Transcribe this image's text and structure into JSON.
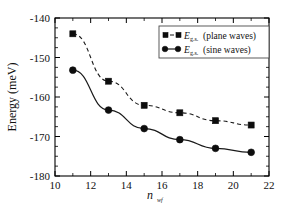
{
  "chart_data": {
    "type": "line",
    "title": "",
    "xlabel": "n_wf",
    "xlabel_base": "n",
    "xlabel_sub": "wf",
    "ylabel": "Energy (meV)",
    "xlim": [
      10,
      22
    ],
    "ylim": [
      -180,
      -140
    ],
    "grid": false,
    "legend_position": "top-right",
    "xticks": [
      10,
      12,
      14,
      16,
      18,
      20,
      22
    ],
    "xticklabels": [
      "10",
      "12",
      "14",
      "16",
      "18",
      "20",
      "22"
    ],
    "yticks": [
      -180,
      -170,
      -160,
      -150,
      -140
    ],
    "yticklabels": [
      "-180",
      "-170",
      "-160",
      "-150",
      "-140"
    ],
    "x": [
      11,
      13,
      15,
      17,
      19,
      21
    ],
    "series": [
      {
        "name": "E_g.s. (plane waves)",
        "label_base": "E",
        "label_sub": "g.s.",
        "label_tail": "(plane waves)",
        "marker": "square",
        "linestyle": "dashed",
        "color": "#0d0d0d",
        "values": [
          -144.0,
          -156.0,
          -162.1,
          -164.0,
          -166.0,
          -167.1
        ]
      },
      {
        "name": "E_g.s. (sine waves)",
        "label_base": "E",
        "label_sub": "g.s.",
        "label_tail": "(sine waves)",
        "marker": "circle",
        "linestyle": "solid",
        "color": "#0d0d0d",
        "values": [
          -153.2,
          -163.3,
          -168.0,
          -170.8,
          -173.0,
          -174.0
        ]
      }
    ]
  },
  "figure": {
    "background": "#ffffff",
    "axis_color": "#000000"
  }
}
